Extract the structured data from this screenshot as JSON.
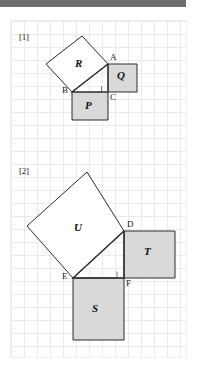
{
  "page": {
    "width": 200,
    "height": 379,
    "background": "#ffffff",
    "banner_color": "#6e6e6e",
    "grid_line_color": "#e8eaee",
    "grid_cell_px": 13,
    "stroke_color": "#2b2b2b",
    "shaded_fill": "#d9d9d9"
  },
  "figures": [
    {
      "tag": "[1]",
      "squares": [
        {
          "name": "R",
          "label": "R",
          "shaded": false
        },
        {
          "name": "Q",
          "label": "Q",
          "shaded": true
        },
        {
          "name": "P",
          "label": "P",
          "shaded": true
        }
      ],
      "vertices": [
        {
          "name": "A",
          "label": "A"
        },
        {
          "name": "B",
          "label": "B"
        },
        {
          "name": "C",
          "label": "C"
        }
      ],
      "right_angle_at": "C"
    },
    {
      "tag": "[2]",
      "squares": [
        {
          "name": "U",
          "label": "U",
          "shaded": false
        },
        {
          "name": "T",
          "label": "T",
          "shaded": true
        },
        {
          "name": "S",
          "label": "S",
          "shaded": true
        }
      ],
      "vertices": [
        {
          "name": "D",
          "label": "D"
        },
        {
          "name": "E",
          "label": "E"
        },
        {
          "name": "F",
          "label": "F"
        }
      ],
      "right_angle_at": "F"
    }
  ],
  "geometry": {
    "fig1": {
      "A": [
        108,
        64
      ],
      "B": [
        72,
        92
      ],
      "C": [
        108,
        92
      ],
      "R_top": [
        82,
        36
      ],
      "R_left": [
        46,
        64
      ],
      "Q_topright": [
        137,
        64
      ],
      "Q_bottomright": [
        137,
        92
      ],
      "P_bottomleft": [
        72,
        120
      ],
      "P_bottomright": [
        108,
        120
      ]
    },
    "fig2": {
      "D": [
        124,
        231
      ],
      "E": [
        73,
        278
      ],
      "F": [
        124,
        278
      ],
      "U_top": [
        87,
        172
      ],
      "U_left": [
        27,
        226
      ],
      "T_topright": [
        175,
        231
      ],
      "T_bottomright": [
        175,
        278
      ],
      "S_bottomleft": [
        73,
        340
      ],
      "S_bottomright": [
        124,
        340
      ]
    }
  },
  "labels": {
    "fig1": {
      "tag_pos": [
        19,
        32
      ],
      "A_pos": [
        110,
        53
      ],
      "B_pos": [
        62,
        86
      ],
      "C_pos": [
        110,
        92
      ],
      "R_pos": [
        76,
        62
      ],
      "Q_pos": [
        117,
        72
      ],
      "P_pos": [
        85,
        100
      ]
    },
    "fig2": {
      "tag_pos": [
        19,
        166
      ],
      "D_pos": [
        127,
        220
      ],
      "E_pos": [
        62,
        272
      ],
      "F_pos": [
        126,
        278
      ],
      "U_pos": [
        76,
        226
      ],
      "T_pos": [
        145,
        248
      ],
      "S_pos": [
        93,
        305
      ]
    }
  }
}
